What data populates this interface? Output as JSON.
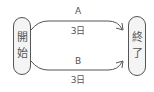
{
  "nodes": {
    "start": {
      "chars": [
        "開",
        "始"
      ]
    },
    "end": {
      "chars": [
        "終",
        "了"
      ]
    }
  },
  "edges": [
    {
      "name": "A",
      "duration": "3日"
    },
    {
      "name": "B",
      "duration": "3日"
    }
  ],
  "colors": {
    "stroke": "#555555",
    "node_fill": "#f4f4f4"
  }
}
